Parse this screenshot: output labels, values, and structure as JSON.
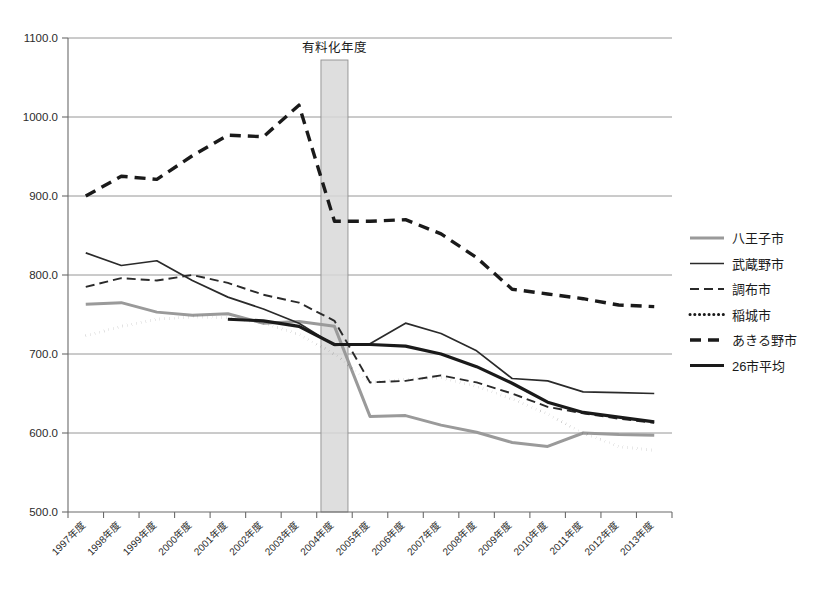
{
  "chart_data": {
    "type": "line",
    "title": "",
    "xlabel": "",
    "ylabel": "",
    "ylim": [
      500.0,
      1100.0
    ],
    "ytick_step": 100.0,
    "ytick_labels": [
      "1100.0",
      "1000.0",
      "900.0",
      "800.0",
      "700.0",
      "600.0",
      "500.0"
    ],
    "ytick_values": [
      1100.0,
      1000.0,
      900.0,
      800.0,
      700.0,
      600.0,
      500.0
    ],
    "grid": "horizontal",
    "legend_position": "right",
    "categories": [
      "1997年度",
      "1998年度",
      "1999年度",
      "2000年度",
      "2001年度",
      "2002年度",
      "2003年度",
      "2004年度",
      "2005年度",
      "2006年度",
      "2007年度",
      "2008年度",
      "2009年度",
      "2010年度",
      "2011年度",
      "2012年度",
      "2013年度"
    ],
    "x": [
      1997,
      1998,
      1999,
      2000,
      2001,
      2002,
      2003,
      2004,
      2005,
      2006,
      2007,
      2008,
      2009,
      2010,
      2011,
      2012,
      2013
    ],
    "series": [
      {
        "name": "八王子市",
        "style": "solid-light",
        "color": "#9a9a9a",
        "width": 3.0,
        "values": [
          763,
          765,
          753,
          749,
          751,
          739,
          741,
          735,
          621,
          622,
          610,
          601,
          588,
          583,
          600,
          598,
          597
        ]
      },
      {
        "name": "武蔵野市",
        "style": "solid-thin",
        "color": "#2a2a2a",
        "width": 1.7,
        "values": [
          828,
          812,
          818,
          793,
          772,
          757,
          739,
          711,
          713,
          739,
          726,
          704,
          669,
          666,
          652,
          651,
          650
        ]
      },
      {
        "name": "調布市",
        "style": "dashed-thin",
        "color": "#2a2a2a",
        "width": 1.9,
        "values": [
          785,
          796,
          793,
          800,
          790,
          775,
          765,
          742,
          664,
          666,
          673,
          664,
          650,
          633,
          625,
          618,
          613
        ]
      },
      {
        "name": "稲城市",
        "style": "dotted",
        "color": "#1a1a1a",
        "width": 3.0,
        "values": [
          723,
          735,
          744,
          747,
          746,
          739,
          725,
          700,
          664,
          668,
          670,
          659,
          643,
          624,
          600,
          583,
          578
        ]
      },
      {
        "name": "あきる野市",
        "style": "dashed-thick",
        "color": "#1a1a1a",
        "width": 3.4,
        "values": [
          900,
          925,
          921,
          951,
          977,
          975,
          1015,
          868,
          868,
          870,
          852,
          822,
          782,
          776,
          770,
          762,
          760
        ]
      },
      {
        "name": "26市平均",
        "style": "solid-thick",
        "color": "#1a1a1a",
        "width": 3.2,
        "values": [
          null,
          null,
          null,
          null,
          744,
          742,
          735,
          712,
          712,
          710,
          700,
          684,
          663,
          639,
          626,
          620,
          614
        ]
      }
    ],
    "annotations": [
      {
        "name": "fee-introduction-band",
        "label": "有料化年度",
        "type": "vertical-band",
        "x_start": 2003.62,
        "x_end": 2004.38,
        "fill": "#d8d8d8"
      }
    ]
  },
  "legend": {
    "items": [
      {
        "label": "八王子市"
      },
      {
        "label": "武蔵野市"
      },
      {
        "label": "調布市"
      },
      {
        "label": "稲城市"
      },
      {
        "label": "あきる野市"
      },
      {
        "label": "26市平均"
      }
    ]
  }
}
